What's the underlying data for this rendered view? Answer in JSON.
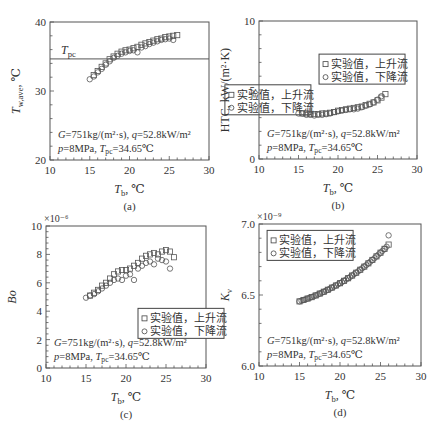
{
  "figure": {
    "panels_count": 4
  },
  "chart_data": [
    {
      "id": "a",
      "type": "scatter",
      "caption": "(a)",
      "title": "",
      "xlabel": "T_b, ℃",
      "ylabel": "T_w,ave, ℃",
      "xlim": [
        10,
        30
      ],
      "ylim": [
        20,
        40
      ],
      "xticks": [
        10,
        15,
        20,
        25,
        30
      ],
      "yticks": [
        20,
        30,
        40
      ],
      "ytick_labels": [
        "20",
        "30",
        "40"
      ],
      "multiplier": "",
      "grid": false,
      "frame": {
        "left": 50,
        "top": 22,
        "right": 209,
        "bottom": 160
      },
      "hline": {
        "y": 34.65,
        "label": "T_pc"
      },
      "legend": {
        "position": "right-middle",
        "x": 32.0,
        "y": 30.9,
        "entries": [
          {
            "marker": "square",
            "label": "实验值，上升流"
          },
          {
            "marker": "circle",
            "label": "实验值，下降流"
          }
        ]
      },
      "annotation": [
        "G=751kg/(m²·s), q=52.8kW/m²",
        "p=8MPa, T_pc=34.65℃"
      ],
      "series": [
        {
          "name": "实验值，上升流",
          "marker": "square",
          "x": [
            15.5,
            16.0,
            16.5,
            17.0,
            17.5,
            18.0,
            18.5,
            19.0,
            19.5,
            20.0,
            20.5,
            21.0,
            21.5,
            22.0,
            22.5,
            23.0,
            23.5,
            24.0,
            24.5,
            25.0,
            25.5,
            26.0
          ],
          "y": [
            32.3,
            32.9,
            33.5,
            34.0,
            34.6,
            35.0,
            35.4,
            35.7,
            35.9,
            36.0,
            36.2,
            36.4,
            36.7,
            36.9,
            37.1,
            37.3,
            37.5,
            37.6,
            37.8,
            37.9,
            38.0,
            38.1
          ]
        },
        {
          "name": "实验值，下降流",
          "marker": "circle",
          "x": [
            15.0,
            15.5,
            16.0,
            16.5,
            17.0,
            17.5,
            18.0,
            18.5,
            19.0,
            19.5,
            20.0,
            20.5,
            21.0,
            21.5,
            22.0,
            22.5,
            23.0,
            23.5,
            24.0,
            24.5,
            25.0,
            25.5
          ],
          "y": [
            31.7,
            32.1,
            32.7,
            33.2,
            33.8,
            34.3,
            34.8,
            35.1,
            35.4,
            35.6,
            35.8,
            35.9,
            35.6,
            36.3,
            36.5,
            36.8,
            37.0,
            37.2,
            37.4,
            37.5,
            37.6,
            37.4
          ]
        }
      ]
    },
    {
      "id": "b",
      "type": "scatter",
      "caption": "(b)",
      "title": "",
      "xlabel": "T_b, ℃",
      "ylabel": "HTC, kW/(m²·K)",
      "xlim": [
        10,
        30
      ],
      "ylim": [
        0,
        10
      ],
      "xticks": [
        10,
        15,
        20,
        25,
        30
      ],
      "yticks": [
        0,
        5,
        10
      ],
      "ytick_labels": [
        "0",
        "5",
        "10"
      ],
      "multiplier": "",
      "grid": false,
      "frame": {
        "left": 259,
        "top": 21,
        "right": 417,
        "bottom": 159
      },
      "legend": {
        "position": "upper-middle",
        "x": 17.6,
        "y": 7.6,
        "entries": [
          {
            "marker": "square",
            "label": "实验值，上升流"
          },
          {
            "marker": "circle",
            "label": "实验值，下降流"
          }
        ]
      },
      "annotation": [
        "G=751kg/(m²·s), q=52.8kW/m²",
        "p=8MPa, T_pc=34.65℃"
      ],
      "series": [
        {
          "name": "实验值，上升流",
          "marker": "square",
          "x": [
            15.5,
            16.0,
            16.5,
            17.0,
            17.5,
            18.0,
            18.5,
            19.0,
            19.5,
            20.0,
            20.5,
            21.0,
            21.5,
            22.0,
            22.5,
            23.0,
            23.5,
            24.0,
            24.5,
            25.0,
            25.5,
            26.0
          ],
          "y": [
            3.3,
            3.3,
            3.25,
            3.25,
            3.25,
            3.3,
            3.3,
            3.35,
            3.4,
            3.5,
            3.55,
            3.6,
            3.65,
            3.7,
            3.75,
            3.8,
            3.9,
            4.0,
            4.1,
            4.25,
            4.45,
            4.7
          ]
        },
        {
          "name": "实验值，下降流",
          "marker": "circle",
          "x": [
            15.0,
            15.5,
            16.0,
            16.5,
            17.0,
            17.5,
            18.0,
            18.5,
            19.0,
            19.5,
            20.0,
            20.5,
            21.0,
            21.5,
            22.0,
            22.5,
            23.0,
            23.5,
            24.0,
            24.5,
            25.0,
            25.5
          ],
          "y": [
            3.3,
            3.3,
            3.2,
            3.2,
            3.15,
            3.2,
            3.2,
            3.25,
            3.3,
            3.4,
            3.45,
            3.5,
            3.55,
            3.6,
            3.6,
            3.65,
            3.75,
            3.85,
            3.95,
            4.1,
            4.3,
            4.55
          ]
        }
      ]
    },
    {
      "id": "c",
      "type": "scatter",
      "caption": "(c)",
      "title": "",
      "xlabel": "T_b, ℃",
      "ylabel": "Bo",
      "xlim": [
        10,
        30
      ],
      "ylim": [
        0,
        10
      ],
      "xticks": [
        10,
        15,
        20,
        25,
        30
      ],
      "yticks": [
        0,
        2,
        4,
        6,
        8,
        10
      ],
      "ytick_labels": [
        "0",
        "2",
        "4",
        "6",
        "8",
        "10"
      ],
      "multiplier": "×10⁻⁶",
      "grid": false,
      "frame": {
        "left": 46,
        "top": 226,
        "right": 206,
        "bottom": 368
      },
      "legend": {
        "position": "right-middle",
        "x": 21.5,
        "y": 4.2,
        "entries": [
          {
            "marker": "square",
            "label": "实验值，上升流"
          },
          {
            "marker": "circle",
            "label": "实验值，下降流"
          }
        ]
      },
      "annotation": [
        "G=751kg/(m²·s), q=52.8kW/m²",
        "p=8MPa, T_pc=34.65℃"
      ],
      "series": [
        {
          "name": "实验值，上升流",
          "marker": "square",
          "x": [
            15.5,
            16.0,
            16.5,
            17.0,
            17.5,
            18.0,
            18.5,
            19.0,
            19.5,
            20.0,
            20.5,
            21.0,
            21.5,
            22.0,
            22.5,
            23.0,
            23.5,
            24.0,
            24.5,
            25.0,
            25.5,
            26.0
          ],
          "y": [
            5.1,
            5.3,
            5.5,
            5.8,
            6.0,
            6.3,
            6.6,
            6.8,
            6.9,
            6.9,
            7.0,
            7.2,
            7.4,
            7.7,
            7.9,
            8.0,
            8.1,
            8.0,
            8.2,
            8.3,
            8.2,
            7.8
          ]
        },
        {
          "name": "实验值，下降流",
          "marker": "circle",
          "x": [
            15.0,
            15.5,
            16.0,
            16.5,
            17.0,
            17.5,
            18.0,
            18.5,
            19.0,
            19.5,
            20.0,
            20.5,
            21.0,
            21.5,
            22.0,
            22.5,
            23.0,
            23.5,
            24.0,
            24.5,
            25.0,
            25.5
          ],
          "y": [
            4.95,
            5.1,
            5.2,
            5.4,
            5.6,
            5.8,
            6.0,
            6.2,
            6.3,
            6.2,
            6.5,
            6.6,
            6.2,
            7.0,
            7.2,
            7.4,
            7.5,
            7.3,
            7.7,
            7.6,
            7.5,
            7.0
          ]
        }
      ]
    },
    {
      "id": "d",
      "type": "scatter",
      "caption": "(d)",
      "title": "",
      "xlabel": "T_b, ℃",
      "ylabel": "K_v",
      "xlim": [
        10,
        30
      ],
      "ylim": [
        6.0,
        7.0
      ],
      "xticks": [
        10,
        15,
        20,
        25,
        30
      ],
      "yticks": [
        6.0,
        6.5,
        7.0
      ],
      "ytick_labels": [
        "6.0",
        "6.5",
        "7.0"
      ],
      "multiplier": "×10⁻⁹",
      "grid": false,
      "frame": {
        "left": 259,
        "top": 224,
        "right": 421,
        "bottom": 366
      },
      "legend": {
        "position": "upper-left",
        "x": 11.0,
        "y": 6.955,
        "entries": [
          {
            "marker": "square",
            "label": "实验值，上升流"
          },
          {
            "marker": "circle",
            "label": "实验值，下降流"
          }
        ]
      },
      "annotation": [
        "G=751kg/(m²·s), q=52.8kW/m²",
        "p=8MPa, T_pc=34.65℃"
      ],
      "series": [
        {
          "name": "实验值，上升流",
          "marker": "square",
          "x": [
            15.0,
            15.5,
            16.0,
            16.5,
            17.0,
            17.5,
            18.0,
            18.5,
            19.0,
            19.5,
            20.0,
            20.5,
            21.0,
            21.5,
            22.0,
            22.5,
            23.0,
            23.5,
            24.0,
            24.5,
            25.0,
            25.5,
            26.0
          ],
          "y": [
            6.455,
            6.465,
            6.475,
            6.485,
            6.497,
            6.51,
            6.523,
            6.537,
            6.552,
            6.567,
            6.583,
            6.6,
            6.618,
            6.637,
            6.657,
            6.678,
            6.7,
            6.723,
            6.747,
            6.772,
            6.798,
            6.825,
            6.855
          ]
        },
        {
          "name": "实验值，下降流",
          "marker": "circle",
          "x": [
            15.0,
            15.25,
            15.5,
            15.75,
            16.0,
            16.25,
            16.5,
            16.75,
            17.0,
            17.25,
            17.5,
            17.75,
            18.0,
            18.25,
            18.5,
            18.75,
            19.0,
            19.25,
            19.5,
            19.75,
            20.0,
            20.25,
            20.5,
            20.75,
            21.0,
            21.25,
            21.5,
            21.75,
            22.0,
            22.25,
            22.5,
            22.75,
            23.0,
            23.25,
            23.5,
            23.75,
            24.0,
            24.25,
            24.5,
            24.75,
            25.0,
            25.25,
            25.5,
            25.75,
            26.0
          ],
          "y": [
            6.455,
            6.46,
            6.465,
            6.47,
            6.475,
            6.48,
            6.485,
            6.491,
            6.497,
            6.503,
            6.51,
            6.516,
            6.523,
            6.53,
            6.537,
            6.544,
            6.552,
            6.559,
            6.567,
            6.575,
            6.583,
            6.591,
            6.6,
            6.609,
            6.618,
            6.627,
            6.637,
            6.647,
            6.657,
            6.667,
            6.678,
            6.689,
            6.7,
            6.711,
            6.723,
            6.735,
            6.747,
            6.759,
            6.772,
            6.785,
            6.798,
            6.811,
            6.825,
            6.84,
            6.92
          ]
        }
      ]
    }
  ]
}
